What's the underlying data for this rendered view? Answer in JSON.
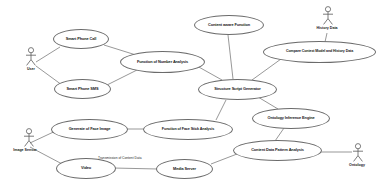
{
  "diagram": {
    "kind": "uml-use-case-diagram",
    "title": "",
    "background_color": "#ffffff",
    "stroke_color": "#6b6b6b",
    "text_color": "#161616"
  },
  "actors": [
    {
      "id": "user",
      "label": "User",
      "x": 14,
      "y": 47
    },
    {
      "id": "image_sensor",
      "label": "Image Sensor",
      "x": 8,
      "y": 128
    },
    {
      "id": "history_data",
      "label": "History Data",
      "x": 310,
      "y": 6
    },
    {
      "id": "ontology",
      "label": "Ontology",
      "x": 340,
      "y": 143
    }
  ],
  "use_cases": [
    {
      "id": "smart_phone_call",
      "label": "Smart Phone Call",
      "x": 53,
      "y": 29,
      "w": 56,
      "h": 20,
      "font": 3.9
    },
    {
      "id": "smart_phone_sms",
      "label": "Smart Phone SMS",
      "x": 54,
      "y": 79,
      "w": 57,
      "h": 20,
      "font": 3.9
    },
    {
      "id": "function_number_analysis",
      "label": "Function of Number Analysis",
      "x": 120,
      "y": 51,
      "w": 85,
      "h": 22,
      "font": 3.9
    },
    {
      "id": "content_aware_function",
      "label": "Content aware Function",
      "x": 194,
      "y": 15,
      "w": 70,
      "h": 20,
      "font": 3.9
    },
    {
      "id": "compare_context_model",
      "label": "Compare Context Model and History Data",
      "x": 263,
      "y": 41,
      "w": 113,
      "h": 22,
      "font": 3.6
    },
    {
      "id": "structure_script_generator",
      "label": "Structure Script Generator",
      "x": 198,
      "y": 79,
      "w": 79,
      "h": 21,
      "font": 3.9
    },
    {
      "id": "ontology_inference_engine",
      "label": "Ontology Inference Engine",
      "x": 252,
      "y": 108,
      "w": 78,
      "h": 21,
      "font": 3.9
    },
    {
      "id": "content_data_pattern_analysis",
      "label": "Content Data Pattern Analysis",
      "x": 233,
      "y": 140,
      "w": 89,
      "h": 21,
      "font": 3.9
    },
    {
      "id": "generate_face_image",
      "label": "Generate of Face Image",
      "x": 51,
      "y": 119,
      "w": 77,
      "h": 21,
      "font": 3.9
    },
    {
      "id": "function_face_stick_analysis",
      "label": "Function of Face Stick Analysis",
      "x": 143,
      "y": 119,
      "w": 90,
      "h": 21,
      "font": 3.7
    },
    {
      "id": "video",
      "label": "Video",
      "x": 56,
      "y": 158,
      "w": 60,
      "h": 21,
      "font": 3.9
    },
    {
      "id": "media_server",
      "label": "Media Server",
      "x": 156,
      "y": 159,
      "w": 57,
      "h": 20,
      "font": 3.9
    }
  ],
  "edge_labels": [
    {
      "id": "transmission_of_content_data",
      "label": "Transmission of Content Data",
      "x": 98,
      "y": 157
    }
  ],
  "edges": [
    {
      "from": "user",
      "to": "smart_phone_call"
    },
    {
      "from": "user",
      "to": "smart_phone_sms"
    },
    {
      "from": "smart_phone_call",
      "to": "function_number_analysis"
    },
    {
      "from": "smart_phone_sms",
      "to": "function_number_analysis"
    },
    {
      "from": "function_number_analysis",
      "to": "structure_script_generator"
    },
    {
      "from": "content_aware_function",
      "to": "structure_script_generator"
    },
    {
      "from": "history_data",
      "to": "compare_context_model"
    },
    {
      "from": "compare_context_model",
      "to": "structure_script_generator"
    },
    {
      "from": "structure_script_generator",
      "to": "ontology_inference_engine"
    },
    {
      "from": "ontology_inference_engine",
      "to": "content_data_pattern_analysis"
    },
    {
      "from": "content_data_pattern_analysis",
      "to": "ontology"
    },
    {
      "from": "image_sensor",
      "to": "generate_face_image"
    },
    {
      "from": "image_sensor",
      "to": "video"
    },
    {
      "from": "generate_face_image",
      "to": "function_face_stick_analysis"
    },
    {
      "from": "function_face_stick_analysis",
      "to": "structure_script_generator"
    },
    {
      "from": "video",
      "to": "media_server"
    },
    {
      "from": "media_server",
      "to": "content_data_pattern_analysis"
    }
  ]
}
